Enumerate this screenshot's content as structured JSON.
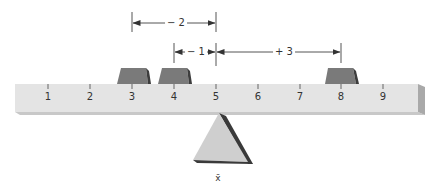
{
  "diagram": {
    "title": "",
    "beam": {
      "tick_labels": [
        "1",
        "2",
        "3",
        "4",
        "5",
        "6",
        "7",
        "8",
        "9"
      ],
      "colors": {
        "face": "#e4e4e4",
        "bottom": "#c8c8c8",
        "end": "#a9a9a9"
      }
    },
    "weights": [
      {
        "position": "3"
      },
      {
        "position": "4"
      },
      {
        "position": "8"
      }
    ],
    "weight_color": "#7a7a7a",
    "dimensions": [
      {
        "label": "− 2",
        "from": "3",
        "to": "5"
      },
      {
        "label": "− 1",
        "from": "4",
        "to": "5"
      },
      {
        "label": "+ 3",
        "from": "5",
        "to": "8"
      }
    ],
    "fulcrum": {
      "position": "5",
      "label": "x̄",
      "color": "#cfcfcf"
    }
  }
}
